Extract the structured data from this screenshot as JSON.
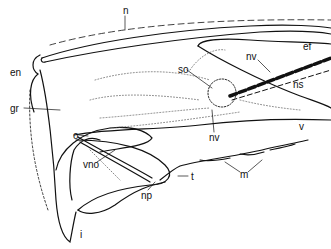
{
  "figure": {
    "type": "anatomical line drawing",
    "colors": {
      "ink": "#111111",
      "stipple": "#555555",
      "background": "#ffffff"
    },
    "labels": [
      {
        "id": "n",
        "text": "n",
        "x": 123,
        "y": 6
      },
      {
        "id": "ef",
        "text": "ef",
        "x": 303,
        "y": 42
      },
      {
        "id": "en",
        "text": "en",
        "x": 10,
        "y": 68
      },
      {
        "id": "so",
        "text": "so",
        "x": 178,
        "y": 65
      },
      {
        "id": "nv1",
        "text": "nv",
        "x": 246,
        "y": 52
      },
      {
        "id": "ns",
        "text": "ns",
        "x": 293,
        "y": 80
      },
      {
        "id": "gr",
        "text": "gr",
        "x": 10,
        "y": 104
      },
      {
        "id": "v",
        "text": "v",
        "x": 299,
        "y": 122
      },
      {
        "id": "nv2",
        "text": "nv",
        "x": 209,
        "y": 133
      },
      {
        "id": "o",
        "text": "o",
        "x": 73,
        "y": 131
      },
      {
        "id": "vno",
        "text": "vno",
        "x": 83,
        "y": 160
      },
      {
        "id": "np",
        "text": "np",
        "x": 141,
        "y": 191
      },
      {
        "id": "t",
        "text": "t",
        "x": 191,
        "y": 172
      },
      {
        "id": "m",
        "text": "m",
        "x": 240,
        "y": 170
      },
      {
        "id": "i",
        "text": "i",
        "x": 80,
        "y": 230
      }
    ]
  }
}
